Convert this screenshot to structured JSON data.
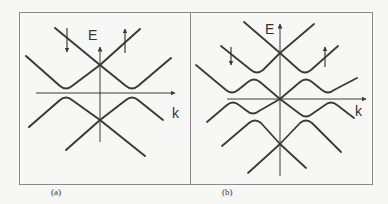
{
  "figure": {
    "background": "#f7f7f5",
    "line_color": "#3a3a3a",
    "frame_color": "#888888",
    "panels": [
      {
        "id": "a",
        "caption": "(a)",
        "axis_labels": {
          "y": "E",
          "x": "k"
        },
        "spin_arrows": [
          {
            "direction": "down",
            "symbol": "↓"
          },
          {
            "direction": "up",
            "symbol": "↑"
          }
        ],
        "description": "Two Dirac cones crossing at k=0, one above and one below the Fermi level, with avoided crossings (gaps) at finite k"
      },
      {
        "id": "b",
        "caption": "(b)",
        "axis_labels": {
          "y": "E",
          "x": "k"
        },
        "spin_arrows": [
          {
            "direction": "down",
            "symbol": "↓"
          },
          {
            "direction": "up",
            "symbol": "↑"
          }
        ],
        "description": "Three Dirac crossings at k=0 stacked in energy with multiple avoided crossings forming oscillating bands"
      }
    ]
  }
}
